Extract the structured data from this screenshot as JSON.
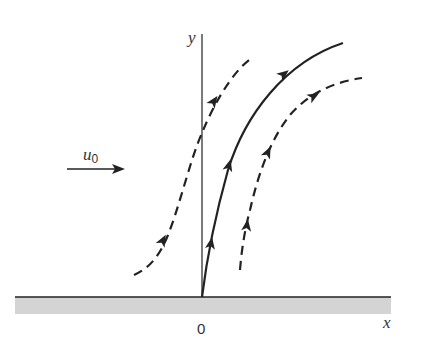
{
  "diagram": {
    "type": "streamline flow diagram near a wall",
    "labels": {
      "y_axis": "y",
      "x_axis": "x",
      "origin": "0",
      "velocity_symbol": "u",
      "velocity_subscript": "0"
    },
    "colors": {
      "stroke": "#222222",
      "wall_fill": "#d4d4d4",
      "background": "#ffffff"
    },
    "elements": [
      {
        "id": "freestream-arrow",
        "description": "Horizontal arrow indicating uniform flow u0 toward the right"
      },
      {
        "id": "left-dashed-streamline",
        "style": "dashed",
        "arrows": 2
      },
      {
        "id": "stagnation-solid-streamline",
        "style": "solid",
        "origin": "0",
        "arrows": 3
      },
      {
        "id": "right-dashed-streamline",
        "style": "dashed",
        "arrows": 3
      },
      {
        "id": "wall",
        "description": "Shaded flat wall along x axis"
      }
    ]
  }
}
